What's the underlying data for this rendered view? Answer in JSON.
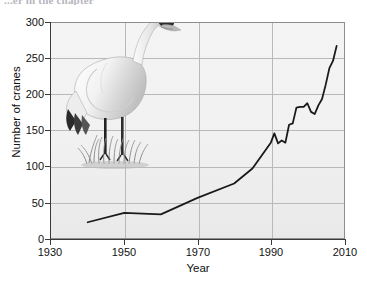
{
  "caption": {
    "clipped_top_text": "...er in the chapter"
  },
  "figure": {
    "y_axis_title": "Number of cranes",
    "x_axis_title": "Year",
    "illustration_name": "whooping-crane-illustration",
    "background_color": "#f1f1f1",
    "line_color": "#1a1a1a",
    "grid_color": "#b9b9b9",
    "axis_color": "#3a3a3a"
  },
  "chart_data": {
    "type": "line",
    "title": "",
    "subtitle": "",
    "xlabel": "Year",
    "ylabel": "Number of cranes",
    "xlim": [
      1930,
      2010
    ],
    "ylim": [
      0,
      300
    ],
    "xticks": [
      1930,
      1950,
      1970,
      1990,
      2010
    ],
    "yticks": [
      0,
      50,
      100,
      150,
      200,
      250,
      300
    ],
    "grid": true,
    "legend": "none",
    "series": [
      {
        "name": "Whooping crane population",
        "x": [
          1940,
          1950,
          1960,
          1970,
          1980,
          1985,
          1990,
          1991,
          1992,
          1993,
          1994,
          1995,
          1996,
          1997,
          1998,
          1999,
          2000,
          2001,
          2002,
          2003,
          2004,
          2005,
          2006,
          2007,
          2008
        ],
        "values": [
          22,
          35,
          33,
          56,
          76,
          97,
          133,
          146,
          132,
          136,
          133,
          158,
          160,
          182,
          183,
          183,
          188,
          176,
          173,
          185,
          194,
          214,
          237,
          247,
          268
        ]
      }
    ]
  }
}
